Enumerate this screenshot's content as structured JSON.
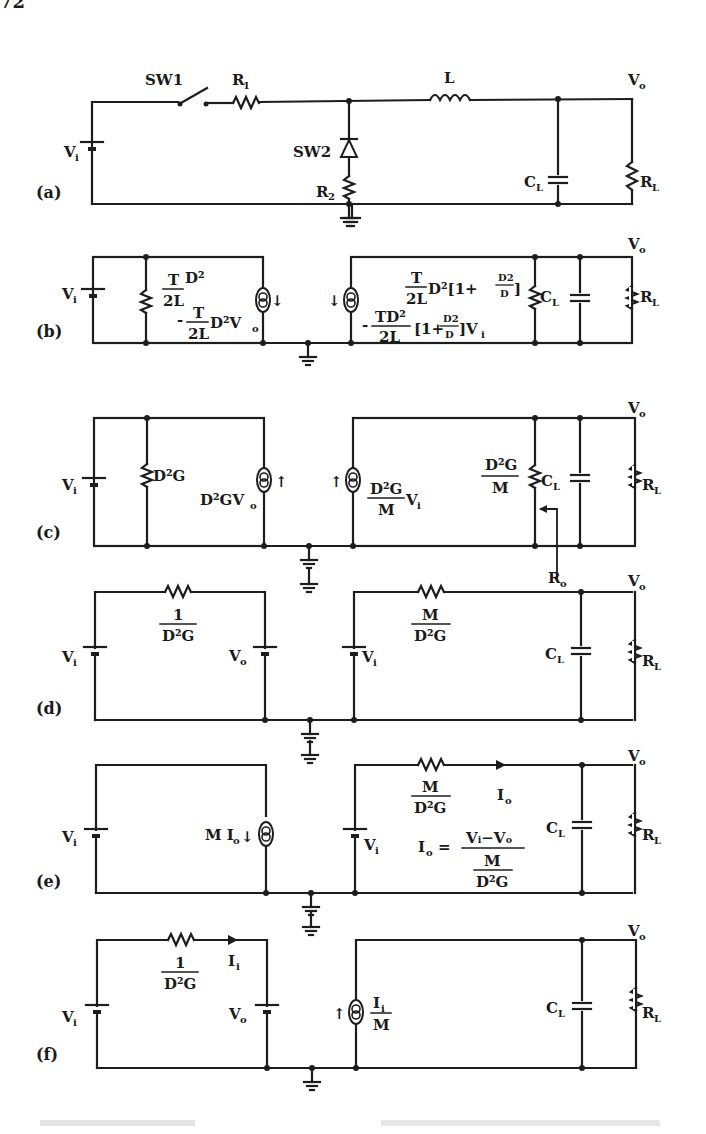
{
  "page": {
    "number": "72"
  },
  "figure": {
    "caption_visible": false,
    "panels": {
      "a": {
        "label": "(a)",
        "sw1": "SW1",
        "r1": "R",
        "r1_sub": "1",
        "l": "L",
        "vo": "V",
        "vo_sub": "o",
        "sw2": "SW2",
        "r2": "R",
        "r2_sub": "2",
        "cl": "C",
        "cl_sub": "L",
        "rl": "R",
        "rl_sub": "L",
        "vi": "V",
        "vi_sub": "i"
      },
      "b": {
        "label": "(b)",
        "vi": "V",
        "vi_sub": "i",
        "vo": "V",
        "vo_sub": "o",
        "res_num": "T",
        "res_den": "2L",
        "res_tail": "D²",
        "src_prefix": "-",
        "src_num": "T",
        "src_den": "2L",
        "src_tail": "D²V",
        "src_tail_sub": "o",
        "rres_num": "T",
        "rres_den": "2L",
        "rres_tail": "D²[1+",
        "rres_frac_num": "D2",
        "rres_frac_den": "D",
        "rres_close": "]",
        "rsrc_prefix": "-",
        "rsrc_num": "TD²",
        "rsrc_den": "2L",
        "rsrc_mid": "[1+",
        "rsrc_frac_num": "D2",
        "rsrc_frac_den": "D",
        "rsrc_close": "]V",
        "rsrc_close_sub": "i",
        "cl": "C",
        "cl_sub": "L",
        "rl": "R",
        "rl_sub": "L"
      },
      "c": {
        "label": "(c)",
        "vi": "V",
        "vi_sub": "i",
        "vo": "V",
        "vo_sub": "o",
        "res": "D²G",
        "src": "D²GV",
        "src_sub": "o",
        "rsrc_num": "D²G",
        "rsrc_den": "M",
        "rsrc_tail": "V",
        "rsrc_tail_sub": "i",
        "rres_num": "D²G",
        "rres_den": "M",
        "cl": "C",
        "cl_sub": "L",
        "rl": "R",
        "rl_sub": "L",
        "ro": "R",
        "ro_sub": "o"
      },
      "d": {
        "label": "(d)",
        "vi": "V",
        "vi_sub": "i",
        "vo_left": "V",
        "vo_left_sub": "o",
        "lres_num": "1",
        "lres_den": "D²G",
        "vi_right": "V",
        "vi_right_sub": "i",
        "rres_num": "M",
        "rres_den": "D²G",
        "vo": "V",
        "vo_sub": "o",
        "cl": "C",
        "cl_sub": "L",
        "rl": "R",
        "rl_sub": "L"
      },
      "e": {
        "label": "(e)",
        "vi": "V",
        "vi_sub": "i",
        "src": "M I",
        "src_sub": "o",
        "vi_right": "V",
        "vi_right_sub": "i",
        "rres_num": "M",
        "rres_den": "D²G",
        "io": "I",
        "io_sub": "o",
        "eq_lhs": "I",
        "eq_lhs_sub": "o",
        "eq_sign": "=",
        "eq_num": "Vᵢ−Vₒ",
        "eq_den_num": "M",
        "eq_den_den": "D²G",
        "vo": "V",
        "vo_sub": "o",
        "cl": "C",
        "cl_sub": "L",
        "rl": "R",
        "rl_sub": "L"
      },
      "f": {
        "label": "(f)",
        "vi": "V",
        "vi_sub": "i",
        "vo_left": "V",
        "vo_left_sub": "o",
        "lres_num": "1",
        "lres_den": "D²G",
        "ii": "I",
        "ii_sub": "i",
        "src_num": "I",
        "src_num_sub": "i",
        "src_den": "M",
        "vo": "V",
        "vo_sub": "o",
        "cl": "C",
        "cl_sub": "L",
        "rl": "R",
        "rl_sub": "L"
      }
    }
  }
}
